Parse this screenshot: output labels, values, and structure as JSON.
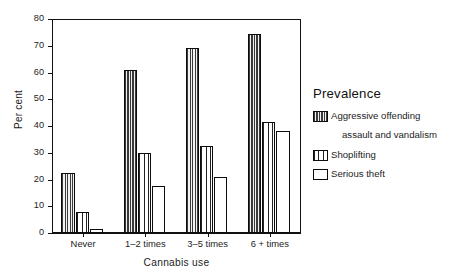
{
  "chart_data": {
    "type": "bar",
    "title": "",
    "xlabel": "Cannabis use",
    "ylabel": "Per cent",
    "categories": [
      "Never",
      "1–2 times",
      "3–5 times",
      "6 + times"
    ],
    "series": [
      {
        "name": "Aggressive offending",
        "name_line2": "assault and vandalism",
        "pattern": "dense-vertical-hatch",
        "values": [
          22.5,
          61,
          69,
          74.5
        ]
      },
      {
        "name": "Shoplifting",
        "pattern": "medium-vertical-hatch",
        "values": [
          8,
          30,
          32.5,
          41.5
        ]
      },
      {
        "name": "Serious theft",
        "pattern": "open-white",
        "values": [
          1.5,
          17.5,
          21,
          38
        ]
      }
    ],
    "ylim": [
      0,
      80
    ],
    "yticks": [
      0,
      10,
      20,
      30,
      40,
      50,
      60,
      70,
      80
    ],
    "ytick_labels": [
      "0",
      "10",
      "20",
      "30",
      "40",
      "50",
      "60",
      "70",
      "80"
    ],
    "grid": false,
    "legend_position": "right",
    "legend_title": "Prevalence"
  },
  "legend": {
    "title": "Prevalence",
    "entries": [
      {
        "label": "Aggressive offending",
        "sublabel": "assault and vandalism",
        "swatch": "dense-hatch-swatch"
      },
      {
        "label": "Shoplifting",
        "sublabel": "",
        "swatch": "medium-hatch-swatch"
      },
      {
        "label": "Serious theft",
        "sublabel": "",
        "swatch": "open-swatch"
      }
    ]
  },
  "colors": {
    "ink": "#111111",
    "hatch_dark": "#3a3a3a",
    "hatch_mid": "#222222",
    "background": "#ffffff"
  }
}
